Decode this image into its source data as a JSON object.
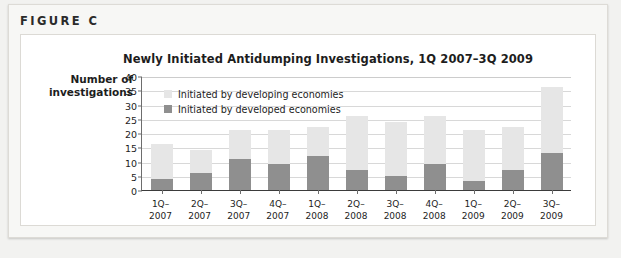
{
  "figure": {
    "label": "FIGURE C"
  },
  "chart_data": {
    "type": "bar",
    "subtype": "stacked-column",
    "title": "Newly Initiated Antidumping Investigations, 1Q 2007–3Q 2009",
    "xlabel": "",
    "ylabel": "Number of investigations",
    "ylabel_lines": [
      "Number of",
      "investigations"
    ],
    "ylim": [
      0,
      40
    ],
    "yticks": [
      0,
      5,
      10,
      15,
      20,
      25,
      30,
      35,
      40
    ],
    "ytick_labels": [
      "0",
      "5",
      "10",
      "15",
      "20",
      "25",
      "30",
      "35",
      "40"
    ],
    "grid": true,
    "grid_axis": "y",
    "legend_position": "inside-top-left",
    "categories": [
      "1Q-2007",
      "2Q-2007",
      "3Q-2007",
      "4Q-2007",
      "1Q-2008",
      "2Q-2008",
      "3Q-2008",
      "4Q-2008",
      "1Q-2009",
      "2Q-2009",
      "3Q-2009"
    ],
    "category_lines": [
      [
        "1Q–",
        "2007"
      ],
      [
        "2Q–",
        "2007"
      ],
      [
        "3Q–",
        "2007"
      ],
      [
        "4Q–",
        "2007"
      ],
      [
        "1Q–",
        "2008"
      ],
      [
        "2Q–",
        "2008"
      ],
      [
        "3Q–",
        "2008"
      ],
      [
        "4Q–",
        "2008"
      ],
      [
        "1Q–",
        "2009"
      ],
      [
        "2Q–",
        "2009"
      ],
      [
        "3Q–",
        "2009"
      ]
    ],
    "series": [
      {
        "name": "Initiated by developed economies",
        "color": "#8f8f8f",
        "stack_order": 0,
        "values": [
          4,
          6,
          11,
          9,
          12,
          7,
          5,
          9,
          3,
          7,
          13
        ]
      },
      {
        "name": "Initiated by developing economies",
        "color": "#e6e6e6",
        "stack_order": 1,
        "values": [
          12,
          8,
          10,
          12,
          10,
          19,
          19,
          17,
          18,
          15,
          23
        ]
      }
    ],
    "totals": [
      16,
      14,
      21,
      21,
      22,
      26,
      24,
      26,
      21,
      22,
      36
    ]
  },
  "legend": {
    "items": [
      {
        "label": "Initiated by developing economies",
        "color": "#e6e6e6"
      },
      {
        "label": "Initiated by developed economies",
        "color": "#8f8f8f"
      }
    ]
  }
}
